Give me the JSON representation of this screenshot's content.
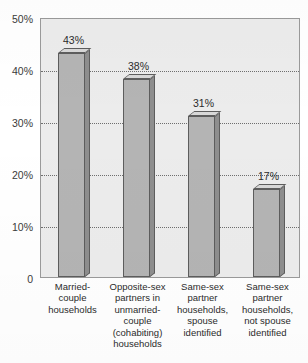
{
  "chart_data": {
    "type": "bar",
    "title": "",
    "subtitle": "",
    "xlabel": "",
    "ylabel": "",
    "categories": [
      "Married-\ncouple\nhouseholds",
      "Opposite-sex\npartners in\nunmarried-\ncouple\n(cohabiting)\nhouseholds",
      "Same-sex\npartner\nhouseholds,\nspouse\nidentified",
      "Same-sex\npartner\nhouseholds,\nnot spouse\nidentified"
    ],
    "values": [
      43,
      38,
      31,
      17
    ],
    "data_labels": [
      "43%",
      "38%",
      "31%",
      "17%"
    ],
    "ylim": [
      0,
      50
    ],
    "yticks": [
      0,
      10,
      20,
      30,
      40,
      50
    ],
    "ytick_labels": [
      "0",
      "10%",
      "20%",
      "30%",
      "40%",
      "50%"
    ],
    "grid": true,
    "grid_style": "dotted",
    "legend": "none",
    "bar_style": "3d",
    "colors": {
      "bar_front": "#b4b4b4",
      "bar_side": "#8e8e8e",
      "bar_top": "#d8d8d8",
      "bar_outline": "#5d5d5d",
      "plot_background": "#ececec",
      "plot_border": "#9a9a9a",
      "gridline": "#6e6e6e",
      "text": "#2b2b2b",
      "page_background": "#ffffff"
    }
  }
}
